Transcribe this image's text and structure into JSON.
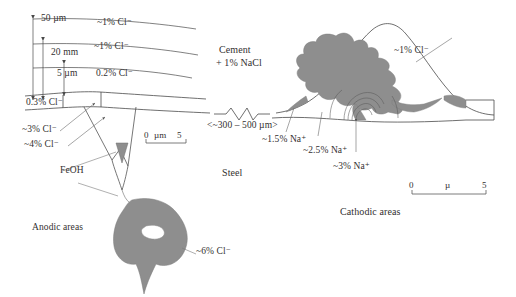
{
  "figure": {
    "title_semantic": "corrosion-pit-anodic-cathodic-diagram",
    "background_color": "#ffffff",
    "ink_color": "#3a3a3a",
    "corrosion_fill_color": "#8e8e8e"
  },
  "left_panel": {
    "name": "anodic-side",
    "dimensions": [
      {
        "id": "dim-50um",
        "label": "50 µm"
      },
      {
        "id": "dim-20mm",
        "label": "20 mm"
      },
      {
        "id": "dim-5um",
        "label": "5 µm"
      }
    ],
    "concentrations": [
      {
        "id": "cl-top-1",
        "label": "~1% Cl⁻"
      },
      {
        "id": "cl-top-2",
        "label": "~1% Cl⁻"
      },
      {
        "id": "cl-02",
        "label": "0.2% Cl⁻"
      },
      {
        "id": "cl-03",
        "label": "0.3% Cl⁻"
      },
      {
        "id": "cl-3",
        "label": "~3% Cl⁻"
      },
      {
        "id": "cl-4",
        "label": "~4% Cl⁻"
      },
      {
        "id": "cl-6",
        "label": "~6% Cl⁻"
      }
    ],
    "feoh_label": "FeOH",
    "area_label": "Anodic areas",
    "scale_bar": {
      "left": "0",
      "unit": "µm",
      "right": "5"
    }
  },
  "center": {
    "cement_label_line1": "Cement",
    "cement_label_line2": "+ 1% NaCl",
    "gap_label": "<~300 – 500 µm>",
    "steel_label": "Steel"
  },
  "right_panel": {
    "name": "cathodic-side",
    "concentrations": [
      {
        "id": "cl-1-right",
        "label": "~1% Cl⁻"
      },
      {
        "id": "na-15",
        "label": "~1.5% Na⁺"
      },
      {
        "id": "na-25",
        "label": "~2.5% Na⁺"
      },
      {
        "id": "na-3",
        "label": "~3% Na⁺"
      }
    ],
    "area_label": "Cathodic areas",
    "scale_bar": {
      "left": "0",
      "unit": "µ",
      "right": "5"
    }
  }
}
